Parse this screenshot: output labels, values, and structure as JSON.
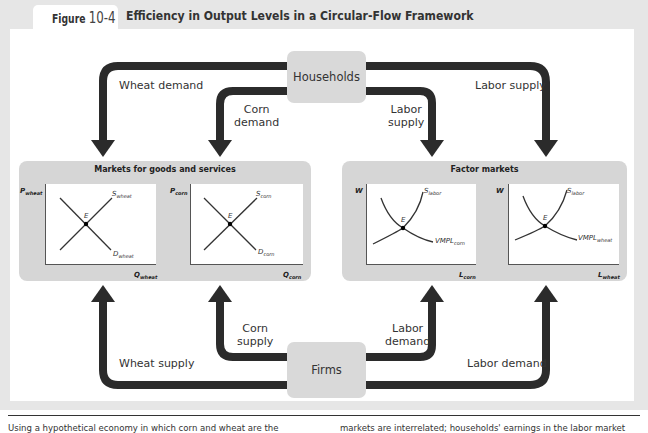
{
  "figure": {
    "label": "Figure",
    "number": "10-4",
    "title": "Efficiency in Output Levels in a Circular-Flow Framework"
  },
  "nodes": {
    "households": "Households",
    "firms": "Firms"
  },
  "flows": {
    "wheat_demand": "Wheat demand",
    "corn_demand_line1": "Corn",
    "corn_demand_line2": "demand",
    "labor_supply_inner_line1": "Labor",
    "labor_supply_inner_line2": "supply",
    "labor_supply_outer": "Labor supply",
    "wheat_supply": "Wheat supply",
    "corn_supply_line1": "Corn",
    "corn_supply_line2": "supply",
    "labor_demand_inner_line1": "Labor",
    "labor_demand_inner_line2": "demand",
    "labor_demand_outer": "Labor demand"
  },
  "markets": {
    "goods": {
      "title": "Markets for goods and services",
      "graphs": [
        {
          "y_axis": "P",
          "y_sub": "wheat",
          "x_axis": "Q",
          "x_sub": "wheat",
          "supply": "S",
          "supply_sub": "wheat",
          "demand": "D",
          "demand_sub": "wheat",
          "eq": "E"
        },
        {
          "y_axis": "P",
          "y_sub": "corn",
          "x_axis": "Q",
          "x_sub": "corn",
          "supply": "S",
          "supply_sub": "corn",
          "demand": "D",
          "demand_sub": "corn",
          "eq": "E"
        }
      ]
    },
    "factor": {
      "title": "Factor markets",
      "graphs": [
        {
          "y_axis": "W",
          "x_axis": "L",
          "x_sub": "corn",
          "supply": "S",
          "supply_sub": "labor",
          "demand": "VMPL",
          "demand_sub": "corn",
          "eq": "E"
        },
        {
          "y_axis": "W",
          "x_axis": "L",
          "x_sub": "wheat",
          "supply": "S",
          "supply_sub": "labor",
          "demand": "VMPL",
          "demand_sub": "wheat",
          "eq": "E"
        }
      ]
    }
  },
  "caption": {
    "left": "Using a hypothetical economy in which corn and wheat are the",
    "right": "markets are interrelated; households' earnings in the labor market"
  },
  "colors": {
    "arrow": "#2b2b2b",
    "node_fill": "#d9d9d9",
    "market_fill": "#d6d6d6",
    "band": "#e6e6e6"
  }
}
